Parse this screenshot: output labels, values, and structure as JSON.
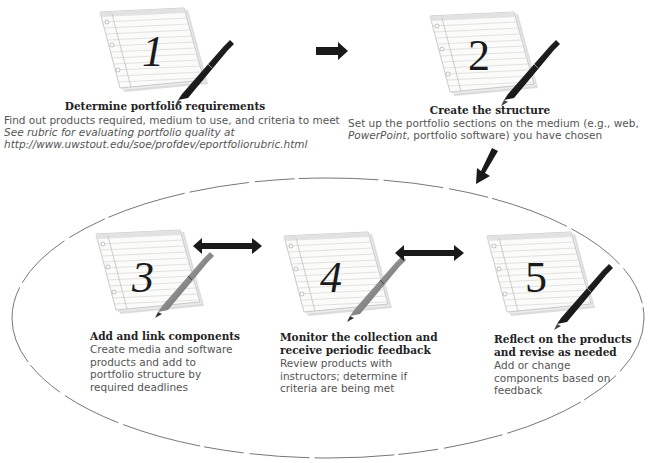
{
  "diagram": {
    "type": "process-flow",
    "steps": [
      {
        "number": "1",
        "title": "Determine portfolio requirements",
        "body": "Find out products required, medium to use, and criteria to meet",
        "note_line1": "See rubric for evaluating portfolio quality at",
        "note_line2": "http://www.uwstout.edu/soe/profdev/eportfoliorubric.html"
      },
      {
        "number": "2",
        "title": "Create the structure",
        "body_line1": "Set up the portfolio sections on the medium (e.g., web,",
        "body_line2_italic": "PowerPoint",
        "body_line2_rest": ", portfolio software) you have chosen"
      },
      {
        "number": "3",
        "title": "Add and link components",
        "body_lines": [
          "Create media and software",
          "products and add to",
          "portfolio structure by",
          "required deadlines"
        ]
      },
      {
        "number": "4",
        "title_lines": [
          "Monitor the collection and",
          "receive periodic feedback"
        ],
        "body_lines": [
          "Review products with",
          "instructors; determine if",
          "criteria are being met"
        ]
      },
      {
        "number": "5",
        "title_lines": [
          "Reflect on the products",
          "and revise as needed"
        ],
        "body_lines": [
          "Add or change",
          "components based on",
          "feedback"
        ]
      }
    ],
    "connectors": [
      {
        "from": "1",
        "to": "2",
        "type": "arrow-right"
      },
      {
        "from": "2",
        "to": "cycle",
        "type": "arrow-down-left"
      },
      {
        "from": "3",
        "to": "4",
        "type": "double-arrow"
      },
      {
        "from": "4",
        "to": "5",
        "type": "double-arrow"
      }
    ],
    "cycle_group": [
      "3",
      "4",
      "5"
    ],
    "colors": {
      "arrow": "#1a1a1a",
      "ellipse": "#777777",
      "paper": "#f7f7f5",
      "paper_lines": "#c8c8c8",
      "pen_dark": "#2a2a2a",
      "pen_light": "#8a8a8a"
    }
  }
}
